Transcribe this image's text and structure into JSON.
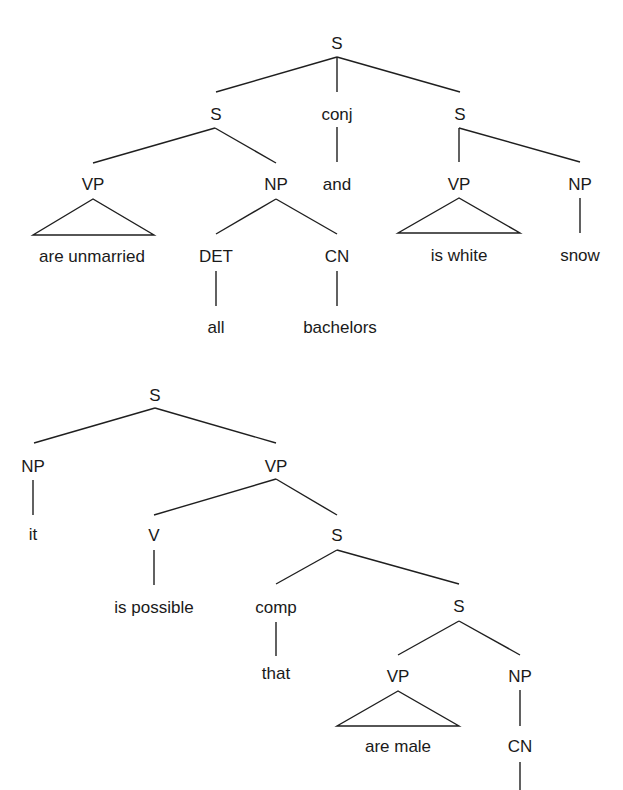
{
  "trees": [
    {
      "id": "tree-1",
      "nodes": [
        {
          "id": "t1-s",
          "label": "S",
          "kind": "category"
        },
        {
          "id": "t1-s-left",
          "label": "S",
          "kind": "category",
          "parent": "t1-s"
        },
        {
          "id": "t1-conj",
          "label": "conj",
          "kind": "category",
          "parent": "t1-s"
        },
        {
          "id": "t1-s-right",
          "label": "S",
          "kind": "category",
          "parent": "t1-s"
        },
        {
          "id": "t1-vp-left",
          "label": "VP",
          "kind": "category",
          "parent": "t1-s-left"
        },
        {
          "id": "t1-np-left",
          "label": "NP",
          "kind": "category",
          "parent": "t1-s-left"
        },
        {
          "id": "t1-and",
          "label": "and",
          "kind": "word",
          "parent": "t1-conj"
        },
        {
          "id": "t1-vp-right",
          "label": "VP",
          "kind": "category",
          "parent": "t1-s-right"
        },
        {
          "id": "t1-np-right",
          "label": "NP",
          "kind": "category",
          "parent": "t1-s-right"
        },
        {
          "id": "t1-are-unmarried",
          "label": "are unmarried",
          "kind": "phrase",
          "parent": "t1-vp-left"
        },
        {
          "id": "t1-det",
          "label": "DET",
          "kind": "category",
          "parent": "t1-np-left"
        },
        {
          "id": "t1-cn",
          "label": "CN",
          "kind": "category",
          "parent": "t1-np-left"
        },
        {
          "id": "t1-is-white",
          "label": "is white",
          "kind": "phrase",
          "parent": "t1-vp-right"
        },
        {
          "id": "t1-snow",
          "label": "snow",
          "kind": "word",
          "parent": "t1-np-right"
        },
        {
          "id": "t1-all",
          "label": "all",
          "kind": "word",
          "parent": "t1-det"
        },
        {
          "id": "t1-bachelors",
          "label": "bachelors",
          "kind": "word",
          "parent": "t1-cn"
        }
      ]
    },
    {
      "id": "tree-2",
      "nodes": [
        {
          "id": "t2-s",
          "label": "S",
          "kind": "category"
        },
        {
          "id": "t2-np",
          "label": "NP",
          "kind": "category",
          "parent": "t2-s"
        },
        {
          "id": "t2-vp",
          "label": "VP",
          "kind": "category",
          "parent": "t2-s"
        },
        {
          "id": "t2-it",
          "label": "it",
          "kind": "word",
          "parent": "t2-np"
        },
        {
          "id": "t2-v",
          "label": "V",
          "kind": "category",
          "parent": "t2-vp"
        },
        {
          "id": "t2-s2",
          "label": "S",
          "kind": "category",
          "parent": "t2-vp"
        },
        {
          "id": "t2-is-possible",
          "label": "is possible",
          "kind": "word",
          "parent": "t2-v"
        },
        {
          "id": "t2-comp",
          "label": "comp",
          "kind": "category",
          "parent": "t2-s2"
        },
        {
          "id": "t2-s3",
          "label": "S",
          "kind": "category",
          "parent": "t2-s2"
        },
        {
          "id": "t2-that",
          "label": "that",
          "kind": "word",
          "parent": "t2-comp"
        },
        {
          "id": "t2-vp2",
          "label": "VP",
          "kind": "category",
          "parent": "t2-s3"
        },
        {
          "id": "t2-np2",
          "label": "NP",
          "kind": "category",
          "parent": "t2-s3"
        },
        {
          "id": "t2-are-male",
          "label": "are male",
          "kind": "phrase",
          "parent": "t2-vp2"
        },
        {
          "id": "t2-cn",
          "label": "CN",
          "kind": "category",
          "parent": "t2-np2"
        }
      ]
    }
  ]
}
